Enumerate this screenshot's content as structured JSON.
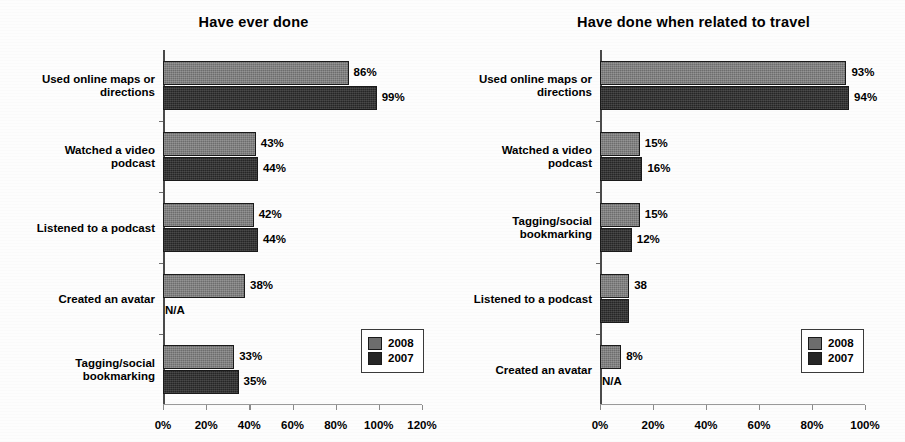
{
  "chart_data": [
    {
      "type": "bar",
      "orientation": "horizontal",
      "title": "Have ever done",
      "xlabel": "",
      "ylabel": "",
      "xlim": [
        0,
        120
      ],
      "xticks": [
        "0%",
        "20%",
        "40%",
        "60%",
        "80%",
        "100%",
        "120%"
      ],
      "xtick_values": [
        0,
        20,
        40,
        60,
        80,
        100,
        120
      ],
      "grid": false,
      "legend_position": "bottom-right",
      "categories": [
        "Used online maps or\ndirections",
        "Watched a video\npodcast",
        "Listened to a podcast",
        "Created an avatar",
        "Tagging/social\nbookmarking"
      ],
      "series": [
        {
          "name": "2008",
          "color": "#6d6d6d",
          "values": [
            86,
            43,
            42,
            38,
            33
          ],
          "labels": [
            "86%",
            "43%",
            "42%",
            "38%",
            "33%"
          ]
        },
        {
          "name": "2007",
          "color": "#262626",
          "values": [
            99,
            44,
            44,
            null,
            35
          ],
          "labels": [
            "99%",
            "44%",
            "44%",
            "N/A",
            "35%"
          ]
        }
      ]
    },
    {
      "type": "bar",
      "orientation": "horizontal",
      "title": "Have done when related to travel",
      "xlabel": "",
      "ylabel": "",
      "xlim": [
        0,
        100
      ],
      "xticks": [
        "0%",
        "20%",
        "40%",
        "60%",
        "80%",
        "100%"
      ],
      "xtick_values": [
        0,
        20,
        40,
        60,
        80,
        100
      ],
      "grid": false,
      "legend_position": "bottom-right",
      "categories": [
        "Used online maps or\ndirections",
        "Watched a video\npodcast",
        "Tagging/social\nbookmarking",
        "Listened to a podcast",
        "Created an avatar"
      ],
      "series": [
        {
          "name": "2008",
          "color": "#6d6d6d",
          "values": [
            93,
            15,
            15,
            11,
            8
          ],
          "labels": [
            "93%",
            "15%",
            "15%",
            "38",
            "8%"
          ]
        },
        {
          "name": "2007",
          "color": "#262626",
          "values": [
            94,
            16,
            12,
            11,
            null
          ],
          "labels": [
            "94%",
            "16%",
            "12%",
            "",
            "N/A"
          ]
        }
      ]
    }
  ],
  "legend": {
    "items": [
      {
        "label": "2008",
        "color": "#6d6d6d"
      },
      {
        "label": "2007",
        "color": "#262626"
      }
    ]
  }
}
